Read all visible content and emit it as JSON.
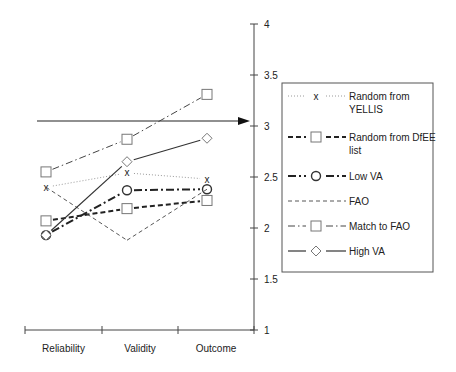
{
  "chart_data": {
    "type": "line",
    "title": "",
    "xlabel": "",
    "ylabel": "",
    "categories": [
      "Reliability",
      "Validity",
      "Outcome"
    ],
    "ylim": [
      1,
      4
    ],
    "yticks": [
      1,
      1.5,
      2,
      2.5,
      3,
      3.5,
      4
    ],
    "ytick_labels": [
      "1",
      "1.5",
      "2",
      "2.5",
      "3",
      "3.5",
      "4"
    ],
    "y_axis_position": "right",
    "grid": false,
    "legend_position": "right",
    "reference_arrow": {
      "y": 3,
      "direction": "right"
    },
    "series": [
      {
        "name": "Random from YELLIS",
        "legend_lines": [
          "Random from",
          "YELLIS"
        ],
        "marker": "x",
        "line_style": "dotted",
        "values": [
          2.4,
          2.54,
          2.48
        ]
      },
      {
        "name": "Random from DfEE list",
        "legend_lines": [
          "Random from DfEE",
          "list"
        ],
        "marker": "square",
        "line_style": "dashed-bold",
        "values": [
          2.07,
          2.19,
          2.27
        ]
      },
      {
        "name": "Low VA",
        "legend_lines": [
          "Low VA"
        ],
        "marker": "circle",
        "line_style": "dash-dot-bold",
        "values": [
          1.93,
          2.37,
          2.38
        ]
      },
      {
        "name": "FAO",
        "legend_lines": [
          "FAO"
        ],
        "marker": "none",
        "line_style": "dashed-thin",
        "values": [
          2.4,
          1.88,
          2.38
        ]
      },
      {
        "name": "Match to FAO",
        "legend_lines": [
          "Match to FAO"
        ],
        "marker": "square",
        "line_style": "dash-dot",
        "values": [
          2.55,
          2.87,
          3.31
        ]
      },
      {
        "name": "High VA",
        "legend_lines": [
          "High VA"
        ],
        "marker": "diamond",
        "line_style": "solid",
        "values": [
          1.93,
          2.65,
          2.88
        ]
      }
    ]
  },
  "colors": {
    "line": "#333333",
    "dotted": "#9a9a9a",
    "marker": "#777777",
    "axis": "#444444",
    "legend_border": "#555555"
  }
}
